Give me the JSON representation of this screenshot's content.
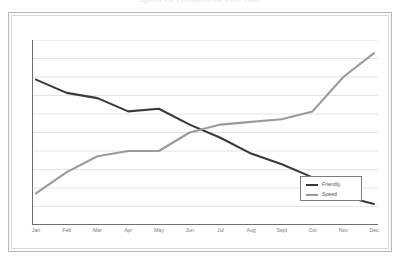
{
  "chart_data": {
    "type": "line",
    "title": "Speed vs. Friendliness Over Time",
    "xlabel": "",
    "ylabel": "",
    "categories": [
      "Jan",
      "Feb",
      "Mar",
      "Apr",
      "May",
      "Jun",
      "Jul",
      "Aug",
      "Sept",
      "Oct",
      "Nov",
      "Dec"
    ],
    "series": [
      {
        "name": "Friendly",
        "color": "#3a3a3a",
        "values": [
          85,
          80,
          78,
          73,
          74,
          68,
          63,
          57,
          53,
          48,
          41,
          38
        ]
      },
      {
        "name": "Speed",
        "color": "#9a9a9a",
        "values": [
          42,
          50,
          56,
          58,
          58,
          65,
          68,
          69,
          70,
          73,
          86,
          95
        ]
      }
    ],
    "ylim": [
      30,
      100
    ],
    "grid": true,
    "grid_lines": 10,
    "y_tick_labels_shown": false,
    "legend_position": "bottom-right"
  },
  "legend": {
    "items": [
      {
        "label": "Friendly",
        "color": "#3a3a3a"
      },
      {
        "label": "Speed",
        "color": "#9a9a9a"
      }
    ]
  },
  "colors": {
    "friendly": "#3a3a3a",
    "speed": "#9a9a9a",
    "grid": "#e4e4e4",
    "axis": "#6f6f6f",
    "frame_outer": "#b9b9b9",
    "frame_inner": "#d6d6d6",
    "tick_label": "#7a7a7a"
  }
}
